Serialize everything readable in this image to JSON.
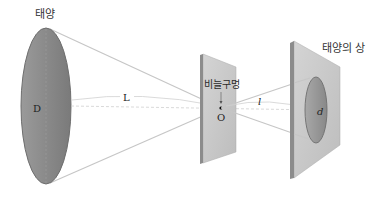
{
  "labels": {
    "sun": "태양",
    "pinhole": "비늘구멍",
    "image": "태양의 상",
    "sun_diameter": "D",
    "distance_sun_pinhole": "L",
    "pinhole_point": "O",
    "distance_pinhole_image": "l",
    "image_diameter": "d"
  },
  "colors": {
    "sun_fill": "#8a8a8a",
    "screen_fill": "#c8c8c8",
    "screen_edge": "#8c8c8c",
    "ray": "#c4c4c4"
  }
}
